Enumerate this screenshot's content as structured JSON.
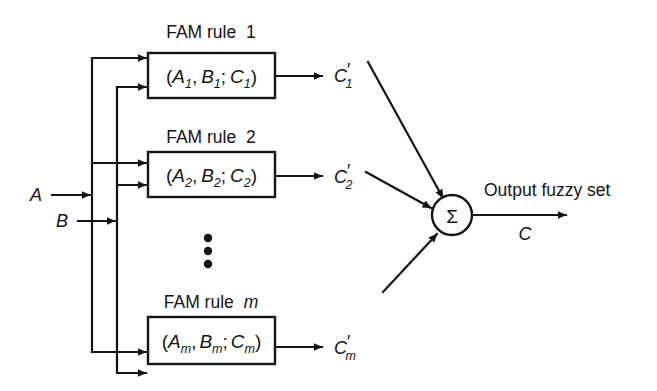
{
  "figure": {
    "kind": "block-diagram",
    "title_visible": false,
    "background_color": "#ffffff",
    "line_color": "#141414",
    "width": 657,
    "height": 391
  },
  "inputs": [
    {
      "name": "input-a",
      "label": "A",
      "italic": true
    },
    {
      "name": "input-b",
      "label": "B",
      "italic": true
    }
  ],
  "rules": [
    {
      "id": "rule-1",
      "title_prefix": "FAM rule",
      "title_index": "1",
      "title_index_italic": false,
      "content_open": "(",
      "content_a": "A",
      "content_a_sub": "1",
      "content_sep1": ",",
      "content_b": "B",
      "content_b_sub": "1",
      "content_sep2": ";",
      "content_c": "C",
      "content_c_sub": "1",
      "content_close": ")",
      "output_label": "C",
      "output_prime": "′",
      "output_sub": "1"
    },
    {
      "id": "rule-2",
      "title_prefix": "FAM rule",
      "title_index": "2",
      "title_index_italic": false,
      "content_open": "(",
      "content_a": "A",
      "content_a_sub": "2",
      "content_sep1": ",",
      "content_b": "B",
      "content_b_sub": "2",
      "content_sep2": ";",
      "content_c": "C",
      "content_c_sub": "2",
      "content_close": ")",
      "output_label": "C",
      "output_prime": "′",
      "output_sub": "2"
    },
    {
      "id": "rule-m",
      "title_prefix": "FAM rule",
      "title_index": "m",
      "title_index_italic": true,
      "content_open": "(",
      "content_a": "A",
      "content_a_sub": "m",
      "content_sep1": ",",
      "content_b": "B",
      "content_b_sub": "m",
      "content_sep2": ";",
      "content_c": "C",
      "content_c_sub": "m",
      "content_close": ")",
      "output_label": "C",
      "output_prime": "′",
      "output_sub": "m"
    }
  ],
  "ellipsis": {
    "name": "vertical-ellipsis",
    "dot_count": 3,
    "glyph": "•"
  },
  "summation": {
    "name": "summation-node",
    "symbol": "Σ"
  },
  "output": {
    "caption": "Output fuzzy set",
    "label": "C",
    "label_italic": true
  }
}
